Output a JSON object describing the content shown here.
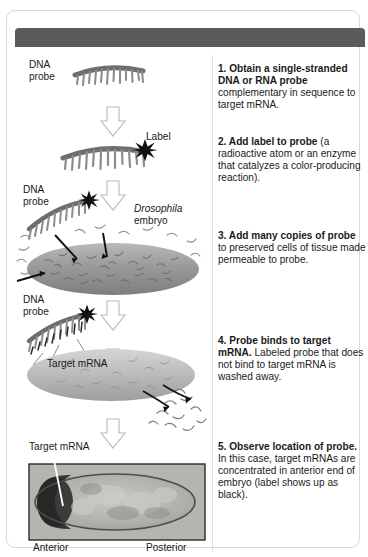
{
  "header": {
    "title": "PROCESS: VISUALIZING mRNAs BY IN SITU HYBRIDIZATION",
    "bar_color": "#5b5b5d",
    "text_color": "#ffffff"
  },
  "illustration_labels": {
    "dna_probe_1": "DNA\nprobe",
    "label_star": "Label",
    "dna_probe_2": "DNA\nprobe",
    "drosophila": "Drosophila",
    "embryo": "embryo",
    "dna_probe_3": "DNA\nprobe",
    "target_mrna_mid": "Target mRNA",
    "target_mrna_bottom": "Target mRNA",
    "anterior": "Anterior",
    "posterior": "Posterior"
  },
  "steps": [
    {
      "number": "1.",
      "bold": "Obtain a single-stranded DNA or RNA probe",
      "rest": "complementary in sequence to target mRNA."
    },
    {
      "number": "2.",
      "bold": "Add label to probe",
      "rest": "(a radioactive atom or an enzyme that catalyzes a color-producing reaction)."
    },
    {
      "number": "3.",
      "bold": "Add many copies of probe",
      "rest": "to preserved cells of tissue made permeable to probe."
    },
    {
      "number": "4.",
      "bold": "Probe binds to target mRNA.",
      "rest": "Labeled probe that does not bind to target mRNA is washed away."
    },
    {
      "number": "5.",
      "bold": "Observe location of probe.",
      "rest": "In this case, target mRNAs are concentrated in anterior end of embryo (label shows up as black)."
    }
  ],
  "colors": {
    "probe_gray": "#8d8d8f",
    "probe_dark": "#5f5f61",
    "embryo_gray": "#9a9a9c",
    "embryo_light": "#c6c6c6",
    "arrow_fill": "#ffffff",
    "arrow_stroke": "#b5b5b5",
    "label_black": "#111111",
    "micrograph_bg": "#b9b9b4",
    "micrograph_dark": "#2a2a28"
  }
}
